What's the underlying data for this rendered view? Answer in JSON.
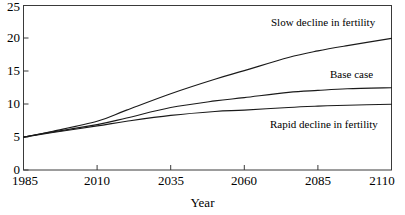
{
  "chart_data": {
    "type": "line",
    "title": "",
    "subtitle": "",
    "xlabel": "Year",
    "ylabel": "",
    "xlim": [
      1985,
      2110
    ],
    "ylim": [
      0,
      25
    ],
    "grid": false,
    "legend_position": "inline-annotations",
    "xticks": [
      "1985",
      "2010",
      "2035",
      "2060",
      "2085",
      "2110"
    ],
    "yticks": [
      "0",
      "5",
      "10",
      "15",
      "20",
      "25"
    ],
    "x": [
      1985,
      1995,
      2010,
      2020,
      2035,
      2050,
      2060,
      2075,
      2085,
      2095,
      2110
    ],
    "series": [
      {
        "name": "Slow decline in fertility",
        "values": [
          5.0,
          5.9,
          7.4,
          9.1,
          11.6,
          13.8,
          15.1,
          17.1,
          18.1,
          18.9,
          20.0
        ],
        "color": "#1a1a1a",
        "label_text": "Slow decline in fertility"
      },
      {
        "name": "Base case",
        "values": [
          5.0,
          5.8,
          6.9,
          7.9,
          9.5,
          10.5,
          11.0,
          11.8,
          12.1,
          12.35,
          12.5
        ],
        "color": "#1a1a1a",
        "label_text": "Base case"
      },
      {
        "name": "Rapid decline in fertility",
        "values": [
          5.0,
          5.7,
          6.7,
          7.4,
          8.3,
          8.9,
          9.1,
          9.5,
          9.7,
          9.85,
          10.0
        ],
        "color": "#1a1a1a",
        "label_text": "Rapid decline in fertility"
      }
    ],
    "annotations": [
      {
        "text": "Slow decline in fertility",
        "x": 2068,
        "y": 22.3
      },
      {
        "text": "Base case",
        "x": 2078,
        "y": 14.6
      },
      {
        "text": "Rapid decline in fertility",
        "x": 2062,
        "y": 7.1
      }
    ]
  },
  "axis": {
    "x_title": "Year",
    "x_tick_labels": [
      "1985",
      "2010",
      "2035",
      "2060",
      "2085",
      "2110"
    ],
    "y_tick_labels": [
      "0",
      "5",
      "10",
      "15",
      "20",
      "25"
    ]
  },
  "annotations": {
    "slow": "Slow decline in fertility",
    "base": "Base case",
    "rapid": "Rapid decline in fertility"
  },
  "style": {
    "line_color": "#1a1a1a",
    "axis_color": "#3a3a3a",
    "background": "#ffffff"
  }
}
